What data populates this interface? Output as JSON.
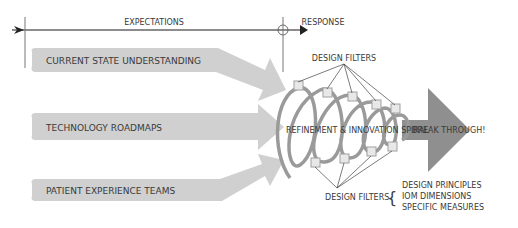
{
  "timeline": {
    "expectations_label": "EXPECTATIONS",
    "response_label": "RESPONSE"
  },
  "inputs": [
    {
      "label": "CURRENT STATE UNDERSTANDING"
    },
    {
      "label": "TECHNOLOGY ROADMAPS"
    },
    {
      "label": "PATIENT EXPERIENCE TEAMS"
    }
  ],
  "spiral": {
    "label": "REFINEMENT & INNOVATION SPIRAL",
    "outcome_label": "BREAK THROUGH!"
  },
  "filters": {
    "top_label": "DESIGN FILTERS",
    "bottom_label": "DESIGN FILTERS",
    "brace": "{",
    "items": [
      "DESIGN PRINCIPLES",
      "IOM DIMENSIONS",
      "SPECIFIC MEASURES"
    ]
  },
  "colors": {
    "arrow_fill": "#d0d0d0",
    "spiral_stroke": "#9a9a9a",
    "breakthrough_fill": "#8f8f8f",
    "line": "#555555",
    "text": "#3a3a3a"
  }
}
